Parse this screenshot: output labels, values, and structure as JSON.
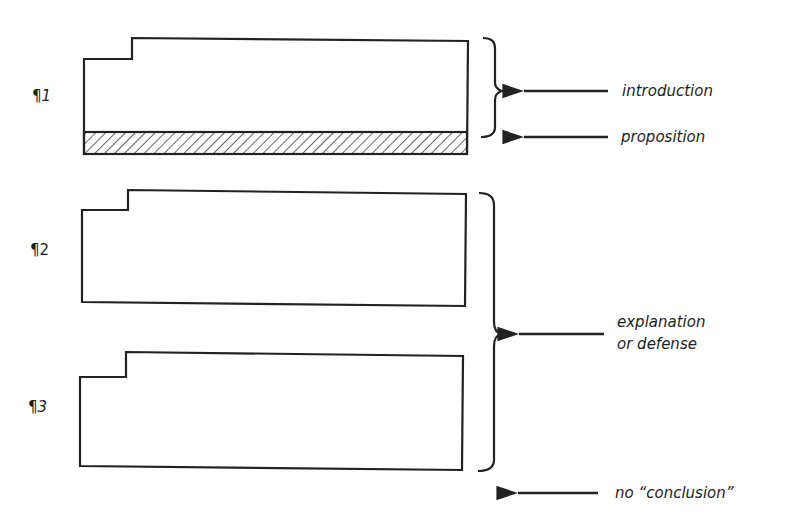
{
  "diagram": {
    "stroke_color": "#222222",
    "paragraphs": [
      {
        "marker": "¶",
        "number": "1",
        "has_proposition_band": true
      },
      {
        "marker": "¶",
        "number": "2",
        "has_proposition_band": false
      },
      {
        "marker": "¶",
        "number": "3",
        "has_proposition_band": false
      }
    ],
    "annotations": [
      {
        "label": "introduction",
        "target": "paragraph 1 (brace)"
      },
      {
        "label": "proposition",
        "target": "hatched band at end of paragraph 1"
      },
      {
        "label_line1": "explanation",
        "label_line2": "or defense",
        "target": "paragraphs 2 and 3 (brace)"
      },
      {
        "label": "no “conclusion”",
        "target": "after paragraph 3"
      }
    ]
  }
}
